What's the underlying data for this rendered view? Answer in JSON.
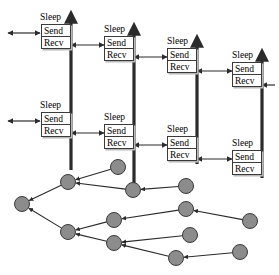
{
  "diagram": {
    "labels": {
      "sleep": "Sleep",
      "send": "Send",
      "recv": "Recv"
    },
    "colors": {
      "line": "#2b2b2b",
      "box_border": "#3a3a3a",
      "box_fill": "#ffffff",
      "box_shadow": "#b9b9b9",
      "node_fill": "#8c8c8c",
      "node_stroke": "#3a3a3a",
      "background": "#ffffff"
    },
    "timelines": [
      {
        "id": "timeline-1",
        "axis_x": 71,
        "axis_top": 14,
        "axis_bottom": 170,
        "slots": [
          {
            "id": "t1-slot-1",
            "sleep_label": "Sleep",
            "sleep_x": 40,
            "sleep_y": 12,
            "box_x": 41,
            "box_y": 24,
            "box_w": 30,
            "send_label": "Send",
            "recv_label": "Recv"
          },
          {
            "id": "t1-slot-2",
            "sleep_label": "Sleep",
            "sleep_x": 40,
            "sleep_y": 100,
            "box_x": 41,
            "box_y": 112,
            "box_w": 30,
            "send_label": "Send",
            "recv_label": "Recv"
          }
        ]
      },
      {
        "id": "timeline-2",
        "axis_x": 134,
        "axis_top": 26,
        "axis_bottom": 186,
        "slots": [
          {
            "id": "t2-slot-1",
            "sleep_label": "Sleep",
            "sleep_x": 104,
            "sleep_y": 24,
            "box_x": 104,
            "box_y": 36,
            "box_w": 30,
            "send_label": "Send",
            "recv_label": "Recv"
          },
          {
            "id": "t2-slot-2",
            "sleep_label": "Sleep",
            "sleep_x": 104,
            "sleep_y": 112,
            "box_x": 104,
            "box_y": 124,
            "box_w": 30,
            "send_label": "Send",
            "recv_label": "Recv"
          }
        ]
      },
      {
        "id": "timeline-3",
        "axis_x": 197,
        "axis_top": 38,
        "axis_bottom": 164,
        "slots": [
          {
            "id": "t3-slot-1",
            "sleep_label": "Sleep",
            "sleep_x": 167,
            "sleep_y": 36,
            "box_x": 167,
            "box_y": 48,
            "box_w": 30,
            "send_label": "Send",
            "recv_label": "Recv"
          },
          {
            "id": "t3-slot-2",
            "sleep_label": "Sleep",
            "sleep_x": 167,
            "sleep_y": 124,
            "box_x": 167,
            "box_y": 136,
            "box_w": 30,
            "send_label": "Send",
            "recv_label": "Recv"
          }
        ]
      },
      {
        "id": "timeline-4",
        "axis_x": 262,
        "axis_top": 52,
        "axis_bottom": 178,
        "slots": [
          {
            "id": "t4-slot-1",
            "sleep_label": "Sleep",
            "sleep_x": 232,
            "sleep_y": 50,
            "box_x": 232,
            "box_y": 62,
            "box_w": 30,
            "send_label": "Send",
            "recv_label": "Recv"
          },
          {
            "id": "t4-slot-2",
            "sleep_label": "Sleep",
            "sleep_x": 232,
            "sleep_y": 138,
            "box_x": 232,
            "box_y": 150,
            "box_w": 30,
            "send_label": "Send",
            "recv_label": "Recv"
          }
        ]
      }
    ],
    "tree": {
      "node_radius": 7.5,
      "nodes": [
        {
          "id": "n-root",
          "x": 22,
          "y": 204
        },
        {
          "id": "n-a",
          "x": 68,
          "y": 182
        },
        {
          "id": "n-b",
          "x": 118,
          "y": 167
        },
        {
          "id": "n-c",
          "x": 133,
          "y": 190
        },
        {
          "id": "n-d",
          "x": 186,
          "y": 186
        },
        {
          "id": "n-e",
          "x": 68,
          "y": 232
        },
        {
          "id": "n-f",
          "x": 114,
          "y": 220
        },
        {
          "id": "n-g",
          "x": 186,
          "y": 209
        },
        {
          "id": "n-h",
          "x": 250,
          "y": 221
        },
        {
          "id": "n-i",
          "x": 114,
          "y": 243
        },
        {
          "id": "n-j",
          "x": 190,
          "y": 235
        },
        {
          "id": "n-k",
          "x": 176,
          "y": 258
        },
        {
          "id": "n-l",
          "x": 240,
          "y": 252
        }
      ],
      "edges": [
        {
          "from": "n-a",
          "to": "n-root"
        },
        {
          "from": "n-e",
          "to": "n-root"
        },
        {
          "from": "n-b",
          "to": "n-a"
        },
        {
          "from": "n-c",
          "to": "n-a"
        },
        {
          "from": "n-d",
          "to": "n-c"
        },
        {
          "from": "n-f",
          "to": "n-e"
        },
        {
          "from": "n-i",
          "to": "n-e"
        },
        {
          "from": "n-g",
          "to": "n-f"
        },
        {
          "from": "n-h",
          "to": "n-g"
        },
        {
          "from": "n-j",
          "to": "n-i"
        },
        {
          "from": "n-k",
          "to": "n-i"
        },
        {
          "from": "n-l",
          "to": "n-k"
        }
      ]
    },
    "message_arrows": [
      {
        "id": "arrow-in-1",
        "x1": 8,
        "y1": 33,
        "x2": 40,
        "y2": 33,
        "heads": "both"
      },
      {
        "id": "arrow-1-2",
        "x1": 71,
        "y1": 45,
        "x2": 104,
        "y2": 45,
        "heads": "both"
      },
      {
        "id": "arrow-in-2",
        "x1": 8,
        "y1": 121,
        "x2": 40,
        "y2": 121,
        "heads": "both"
      },
      {
        "id": "arrow-2-3",
        "x1": 134,
        "y1": 57,
        "x2": 167,
        "y2": 57,
        "heads": "both"
      },
      {
        "id": "arrow-1b-2b",
        "x1": 71,
        "y1": 133,
        "x2": 104,
        "y2": 133,
        "heads": "both"
      },
      {
        "id": "arrow-3-4",
        "x1": 197,
        "y1": 71,
        "x2": 232,
        "y2": 71,
        "heads": "both"
      },
      {
        "id": "arrow-2b-3b",
        "x1": 134,
        "y1": 145,
        "x2": 167,
        "y2": 145,
        "heads": "both"
      },
      {
        "id": "arrow-3b-4b",
        "x1": 197,
        "y1": 159,
        "x2": 232,
        "y2": 159,
        "heads": "both"
      },
      {
        "id": "arrow-out-4",
        "x1": 262,
        "y1": 85,
        "x2": 275,
        "y2": 85,
        "heads": "left"
      }
    ]
  }
}
